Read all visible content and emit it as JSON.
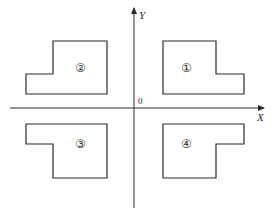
{
  "diagram": {
    "type": "coordinate-plane-quadrant-shapes",
    "axes": {
      "x_label": "X",
      "y_label": "Y",
      "origin_label": "0",
      "x_axis": {
        "y": 108,
        "x1": 10,
        "x2": 264
      },
      "y_axis": {
        "x": 134,
        "y1": 208,
        "y2": 8
      }
    },
    "shapes": [
      {
        "id": "1",
        "label": "①",
        "quadrant": "I",
        "points": "163,41 216,41 216,74 244,74 244,94 163,94",
        "label_pos": {
          "x": 187,
          "y": 72
        }
      },
      {
        "id": "2",
        "label": "②",
        "quadrant": "II",
        "points": "53,41 107,41 107,94 26,94 26,74 53,74",
        "label_pos": {
          "x": 82,
          "y": 72
        }
      },
      {
        "id": "3",
        "label": "③",
        "quadrant": "III",
        "points": "26,124 107,124 107,178 53,178 53,144 26,144",
        "label_pos": {
          "x": 82,
          "y": 148
        }
      },
      {
        "id": "4",
        "label": "④",
        "quadrant": "IV",
        "points": "163,124 244,124 244,144 216,144 216,178 163,178",
        "label_pos": {
          "x": 188,
          "y": 148
        }
      }
    ],
    "colors": {
      "stroke": "#2a2a2a",
      "background": "#ffffff"
    }
  }
}
